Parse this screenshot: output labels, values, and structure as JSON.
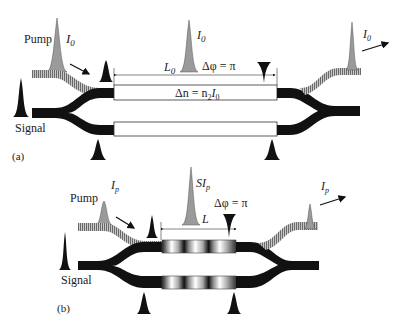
{
  "panel_a": {
    "tag": "(a)",
    "pump_label": "Pump",
    "pump_intensity": "I",
    "pump_intensity_sub": "0",
    "signal_label": "Signal",
    "length_label": "L",
    "length_sub": "0",
    "middle_intensity": "I",
    "middle_intensity_sub": "0",
    "phase_label": "Δφ = π",
    "index_label_prefix": "Δn = n",
    "index_label_sub1": "2",
    "index_label_mid": "I",
    "index_label_sub2": "0",
    "output_intensity": "I",
    "output_intensity_sub": "0"
  },
  "panel_b": {
    "tag": "(b)",
    "pump_label": "Pump",
    "pump_intensity": "I",
    "pump_intensity_sub": "p",
    "signal_label": "Signal",
    "length_label": "L",
    "middle_intensity": "SI",
    "middle_intensity_sub": "p",
    "phase_label": "Δφ = π",
    "output_intensity": "I",
    "output_intensity_sub": "p"
  },
  "colors": {
    "waveguide": "#111111",
    "pump_waveguide": "#8a8a8a",
    "pump_pulse": "#9a9a9a",
    "signal_pulse": "#111111"
  }
}
